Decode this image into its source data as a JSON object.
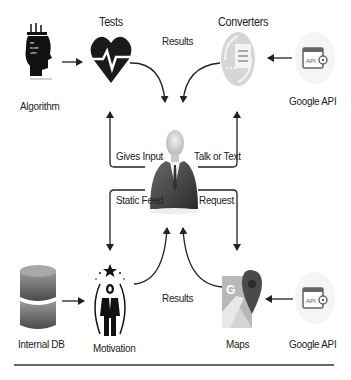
{
  "diagram": {
    "nodes": {
      "algorithm": {
        "label": "Algorithm",
        "icon": "brain-head-icon"
      },
      "tests": {
        "label": "Tests",
        "icon": "heartbeat-icon"
      },
      "converters": {
        "label": "Converters",
        "icon": "document-converter-icon"
      },
      "google_api_top": {
        "label": "Google API",
        "icon": "api-gear-icon"
      },
      "user": {
        "label": "",
        "icon": "user-avatar"
      },
      "internal_db": {
        "label": "Internal DB",
        "icon": "database-icon"
      },
      "motivation": {
        "label": "Motivation",
        "icon": "motivated-person-icon"
      },
      "maps": {
        "label": "Maps",
        "icon": "google-maps-icon"
      },
      "google_api_bottom": {
        "label": "Google API",
        "icon": "api-gear-icon"
      }
    },
    "edges": {
      "results_top": "Results",
      "gives_input": "Gives Input",
      "talk_or_text": "Talk or Text",
      "static_feed": "Static Feed",
      "request": "Request",
      "results_bottom": "Results"
    },
    "colors": {
      "arrow": "#222222",
      "icon_dark": "#1a1a1a",
      "icon_gray": "#9a9a9a",
      "db_gray": "#6e6e6e",
      "maps_pin": "#4a4a4a",
      "maps_light": "#b8b8b8"
    }
  }
}
